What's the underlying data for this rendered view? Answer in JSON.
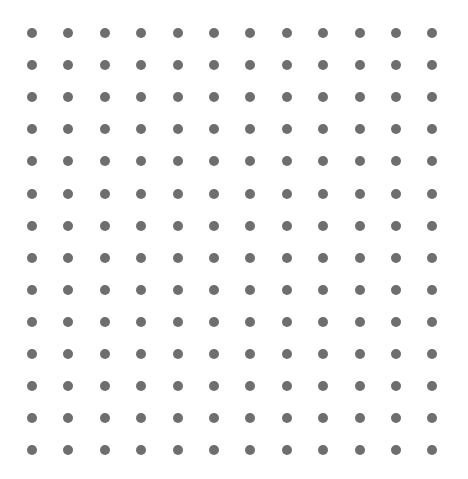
{
  "canvas": {
    "name": "dot-grid",
    "width": 468,
    "height": 479,
    "background_color": "#ffffff"
  },
  "chart_data": {
    "type": "scatter",
    "title": "",
    "subtitle": "",
    "xlabel": "",
    "ylabel": "",
    "grid": false,
    "legend": null,
    "annotations": [],
    "marker": {
      "shape": "circle",
      "color": "#6e6e6e",
      "diameter_px": 10,
      "edge_color": "none",
      "opacity": 1
    },
    "layout": {
      "columns": 12,
      "rows": 14,
      "total_points": 168,
      "x_start_px": 32,
      "y_start_px": 33,
      "x_spacing_px": 36.4,
      "y_spacing_px": 32.1,
      "x_end_px": 432,
      "y_end_px": 450
    },
    "xlim": [
      0,
      468
    ],
    "ylim": [
      0,
      479
    ],
    "x": [
      32,
      68.4,
      104.8,
      141.2,
      177.6,
      214,
      250.4,
      286.8,
      323.2,
      359.6,
      396,
      432.4
    ],
    "y": [
      33,
      65.1,
      97.2,
      129.3,
      161.4,
      193.5,
      225.6,
      257.7,
      289.8,
      321.9,
      354,
      386.1,
      418.2,
      450.3
    ]
  }
}
